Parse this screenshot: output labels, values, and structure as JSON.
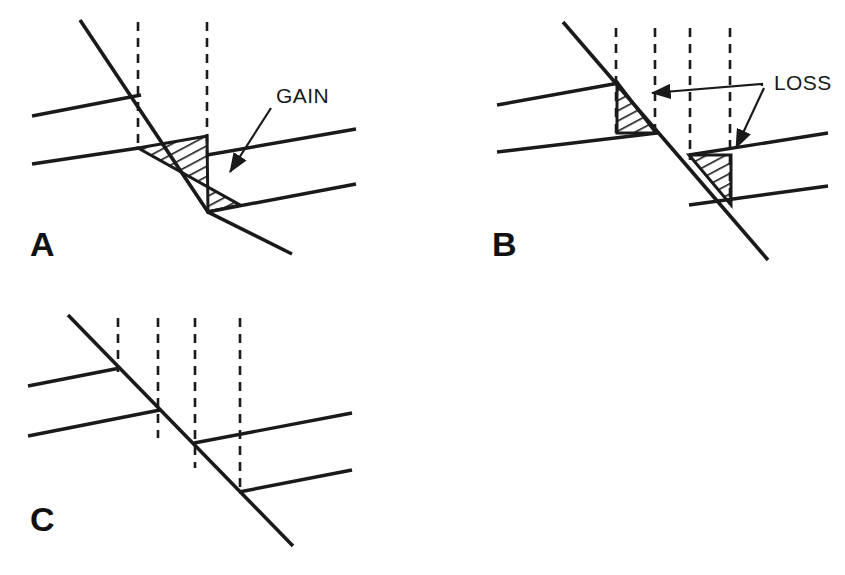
{
  "figure": {
    "background_color": "#ffffff",
    "line_color": "#1a1a1a",
    "width": 845,
    "height": 575
  },
  "panels": [
    {
      "id": "A",
      "label": "A",
      "label_x": 30,
      "label_y": 256,
      "annotation": {
        "text": "GAIN",
        "x": 276,
        "y": 103,
        "arrow_from_x": 268,
        "arrow_from_y": 110,
        "arrow_to_x": 228,
        "arrow_to_y": 174
      },
      "fault": {
        "x1": 80,
        "y1": 20,
        "x2": 208,
        "y2": 212,
        "x3": 292,
        "y3": 254
      },
      "dashed_lines": [
        {
          "x": 138,
          "y1": 22,
          "y2": 150
        },
        {
          "x": 207,
          "y1": 22,
          "y2": 158
        }
      ],
      "beds_left": [
        {
          "x1": 32,
          "y1": 116,
          "x2": 140,
          "y2": 95
        },
        {
          "x1": 32,
          "y1": 164,
          "x2": 139,
          "y2": 148
        }
      ],
      "beds_right": [
        {
          "x1": 208,
          "y1": 155,
          "x2": 356,
          "y2": 129
        },
        {
          "x1": 208,
          "y1": 212,
          "x2": 356,
          "y2": 184
        }
      ],
      "hatched_regions": [
        {
          "name": "gain-wedge",
          "points": "138,148 207,136 207,158 208,212 240,205 208,212"
        }
      ]
    },
    {
      "id": "B",
      "label": "B",
      "label_x": 492,
      "label_y": 256,
      "annotation": {
        "text": "LOSS",
        "x": 774,
        "y": 90,
        "junction_x": 762,
        "junction_y": 86,
        "arrow1_to_x": 648,
        "arrow1_to_y": 93,
        "arrow2_to_x": 734,
        "arrow2_to_y": 150
      },
      "fault": {
        "x1": 563,
        "y1": 22,
        "x2": 768,
        "y2": 260
      },
      "dashed_lines": [
        {
          "x": 616,
          "y1": 28,
          "y2": 140
        },
        {
          "x": 655,
          "y1": 28,
          "y2": 140
        },
        {
          "x": 690,
          "y1": 28,
          "y2": 160
        },
        {
          "x": 730,
          "y1": 28,
          "y2": 205
        }
      ],
      "beds_left": [
        {
          "x1": 497,
          "y1": 105,
          "x2": 618,
          "y2": 83
        },
        {
          "x1": 497,
          "y1": 152,
          "x2": 656,
          "y2": 133
        }
      ],
      "beds_right": [
        {
          "x1": 690,
          "y1": 155,
          "x2": 828,
          "y2": 133
        },
        {
          "x1": 690,
          "y1": 205,
          "x2": 828,
          "y2": 186
        }
      ],
      "hatched_regions": [
        {
          "name": "loss-wedge-upper",
          "points": "617,82 617,133 656,133"
        },
        {
          "name": "loss-wedge-lower",
          "points": "689,155 731,155 731,205"
        }
      ]
    },
    {
      "id": "C",
      "label": "C",
      "label_x": 30,
      "label_y": 531,
      "annotation": null,
      "fault": {
        "x1": 68,
        "y1": 315,
        "x2": 293,
        "y2": 546
      },
      "dashed_lines": [
        {
          "x": 118,
          "y1": 318,
          "y2": 372
        },
        {
          "x": 158,
          "y1": 318,
          "y2": 438
        },
        {
          "x": 195,
          "y1": 318,
          "y2": 468
        },
        {
          "x": 240,
          "y1": 318,
          "y2": 492
        }
      ],
      "beds_left": [
        {
          "x1": 28,
          "y1": 385,
          "x2": 118,
          "y2": 368
        },
        {
          "x1": 28,
          "y1": 436,
          "x2": 158,
          "y2": 410
        }
      ],
      "beds_right": [
        {
          "x1": 195,
          "y1": 443,
          "x2": 352,
          "y2": 413
        },
        {
          "x1": 240,
          "y1": 492,
          "x2": 352,
          "y2": 470
        }
      ],
      "hatched_regions": []
    }
  ]
}
